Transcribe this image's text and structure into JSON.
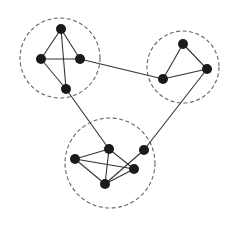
{
  "diagram": {
    "type": "clustered-graph",
    "colors": {
      "node": "#1a1a1a",
      "edge": "#333333",
      "cluster_border": "#666666",
      "background": "#ffffff"
    },
    "clusters": [
      {
        "id": "c1",
        "cx": 60,
        "cy": 58,
        "r": 40
      },
      {
        "id": "c2",
        "cx": 183,
        "cy": 67,
        "r": 36
      },
      {
        "id": "c3",
        "cx": 110,
        "cy": 163,
        "r": 45
      }
    ],
    "nodes": [
      {
        "id": "a1",
        "x": 61,
        "y": 29,
        "cluster": "c1"
      },
      {
        "id": "a2",
        "x": 41,
        "y": 59,
        "cluster": "c1"
      },
      {
        "id": "a3",
        "x": 80,
        "y": 59,
        "cluster": "c1"
      },
      {
        "id": "a4",
        "x": 66,
        "y": 89,
        "cluster": "c1"
      },
      {
        "id": "b1",
        "x": 183,
        "y": 44,
        "cluster": "c2"
      },
      {
        "id": "b2",
        "x": 163,
        "y": 79,
        "cluster": "c2"
      },
      {
        "id": "b3",
        "x": 207,
        "y": 69,
        "cluster": "c2"
      },
      {
        "id": "d1",
        "x": 75,
        "y": 159,
        "cluster": "c3"
      },
      {
        "id": "d2",
        "x": 109,
        "y": 149,
        "cluster": "c3"
      },
      {
        "id": "d3",
        "x": 144,
        "y": 150,
        "cluster": "c3"
      },
      {
        "id": "d4",
        "x": 134,
        "y": 169,
        "cluster": "c3"
      },
      {
        "id": "d5",
        "x": 105,
        "y": 184,
        "cluster": "c3"
      }
    ],
    "edges": [
      [
        "a1",
        "a2"
      ],
      [
        "a1",
        "a3"
      ],
      [
        "a1",
        "a4"
      ],
      [
        "a2",
        "a3"
      ],
      [
        "a2",
        "a4"
      ],
      [
        "a3",
        "b2"
      ],
      [
        "b1",
        "b2"
      ],
      [
        "b1",
        "b3"
      ],
      [
        "b2",
        "b3"
      ],
      [
        "a4",
        "d2"
      ],
      [
        "b3",
        "d3"
      ],
      [
        "d1",
        "d2"
      ],
      [
        "d1",
        "d4"
      ],
      [
        "d1",
        "d5"
      ],
      [
        "d2",
        "d5"
      ],
      [
        "d2",
        "d4"
      ],
      [
        "d5",
        "d4"
      ],
      [
        "d5",
        "d3"
      ]
    ],
    "node_radius": 5
  }
}
